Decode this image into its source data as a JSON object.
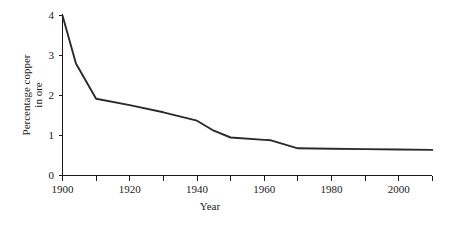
{
  "chart_data": {
    "type": "line",
    "title": "",
    "xlabel": "Year",
    "ylabel": "Percentage copper in ore",
    "ylabel_line1": "Percentage copper",
    "ylabel_line2": "in ore",
    "xlim": [
      1900,
      2010
    ],
    "ylim": [
      0,
      4
    ],
    "grid": false,
    "legend": false,
    "line_color": "#2b2b2b",
    "x_tick_labels": [
      "1900",
      "1920",
      "1940",
      "1960",
      "1980",
      "2000"
    ],
    "x_tick_values": [
      1900,
      1920,
      1940,
      1960,
      1980,
      2000
    ],
    "x_minor_tick_values": [
      1910,
      1930,
      1950,
      1970,
      1990,
      2010
    ],
    "y_tick_labels": [
      "0",
      "1",
      "2",
      "3",
      "4"
    ],
    "y_tick_values": [
      0,
      1,
      2,
      3,
      4
    ],
    "x": [
      1900,
      1904,
      1910,
      1920,
      1930,
      1940,
      1945,
      1950,
      1960,
      1962,
      1970,
      1980,
      1990,
      2000,
      2010
    ],
    "values": [
      4.0,
      2.8,
      1.92,
      1.76,
      1.58,
      1.37,
      1.12,
      0.95,
      0.89,
      0.88,
      0.68,
      0.67,
      0.66,
      0.65,
      0.64
    ],
    "series": [
      {
        "name": "Percentage copper in ore",
        "values": [
          4.0,
          2.8,
          1.92,
          1.76,
          1.58,
          1.37,
          1.12,
          0.95,
          0.89,
          0.88,
          0.68,
          0.67,
          0.66,
          0.65,
          0.64
        ]
      }
    ]
  }
}
